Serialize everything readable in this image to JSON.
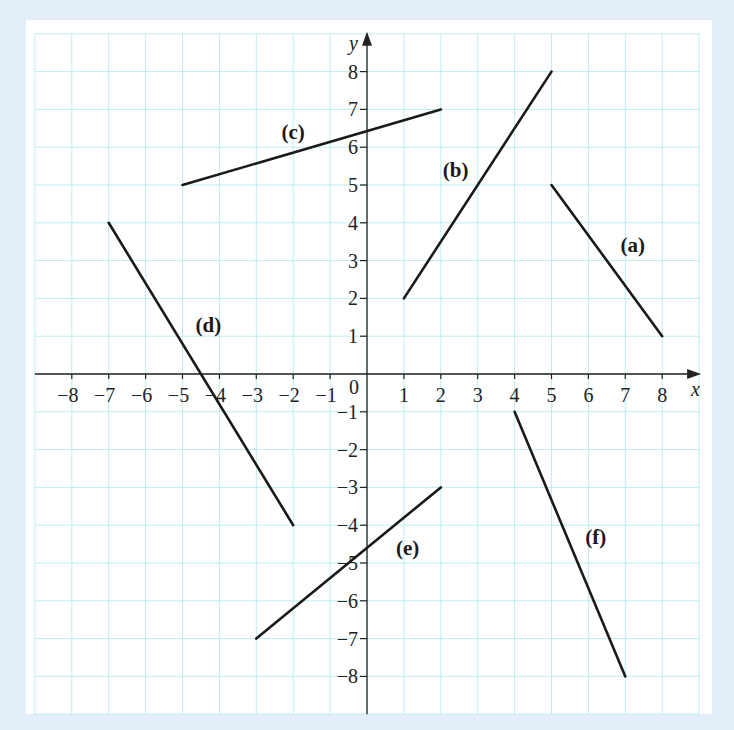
{
  "chart_data": {
    "type": "line",
    "title": "",
    "xlabel": "x",
    "ylabel": "y",
    "xlim": [
      -9,
      9
    ],
    "ylim": [
      -9,
      9
    ],
    "grid": true,
    "origin_label": "0",
    "x_ticks": [
      -8,
      -7,
      -6,
      -5,
      -4,
      -3,
      -2,
      -1,
      1,
      2,
      3,
      4,
      5,
      6,
      7,
      8
    ],
    "y_ticks": [
      8,
      7,
      6,
      5,
      4,
      3,
      2,
      1,
      -1,
      -2,
      -3,
      -4,
      -5,
      -6,
      -7,
      -8
    ],
    "series": [
      {
        "name": "(a)",
        "points": [
          [
            5,
            5
          ],
          [
            8,
            1
          ]
        ],
        "label_pos": [
          7.2,
          3.4
        ]
      },
      {
        "name": "(b)",
        "points": [
          [
            1,
            2
          ],
          [
            5,
            8
          ]
        ],
        "label_pos": [
          2.4,
          5.4
        ]
      },
      {
        "name": "(c)",
        "points": [
          [
            -5,
            5
          ],
          [
            2,
            7
          ]
        ],
        "label_pos": [
          -2.0,
          6.4
        ]
      },
      {
        "name": "(d)",
        "points": [
          [
            -7,
            4
          ],
          [
            -2,
            -4
          ]
        ],
        "label_pos": [
          -4.3,
          1.3
        ]
      },
      {
        "name": "(e)",
        "points": [
          [
            -3,
            -7
          ],
          [
            2,
            -3
          ]
        ],
        "label_pos": [
          1.1,
          -4.6
        ]
      },
      {
        "name": "(f)",
        "points": [
          [
            4,
            -1
          ],
          [
            7,
            -8
          ]
        ],
        "label_pos": [
          6.2,
          -4.3
        ]
      }
    ]
  },
  "colors": {
    "background": "#e3eef8",
    "panel": "#ffffff",
    "grid": "#bdeef0",
    "ink": "#1a1a1a"
  }
}
